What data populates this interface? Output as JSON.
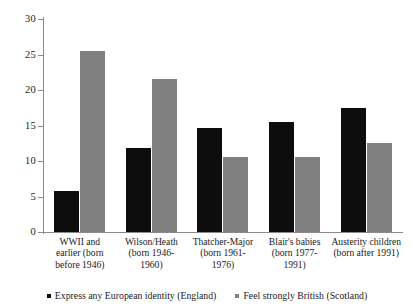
{
  "chart_data": {
    "type": "bar",
    "title": "",
    "xlabel": "",
    "ylabel": "",
    "ylim": [
      0,
      30
    ],
    "yticks": [
      0,
      5,
      10,
      15,
      20,
      25,
      30
    ],
    "grid": false,
    "legend_position": "bottom",
    "categories": [
      "WWII and earlier (born before 1946)",
      "Wilson/Heath (born 1946-1960)",
      "Thatcher-Major (born 1961-1976)",
      "Blair's babies (born 1977-1991)",
      "Austerity children (born after 1991)"
    ],
    "category_lines": [
      [
        "WWII and",
        "earlier (born",
        "before 1946)"
      ],
      [
        "Wilson/Heath",
        "(born 1946-",
        "1960)"
      ],
      [
        "Thatcher-Major",
        "(born 1961-",
        "1976)"
      ],
      [
        "Blair's babies",
        "(born 1977-",
        "1991)"
      ],
      [
        "Austerity children",
        "(born after 1991)"
      ]
    ],
    "series": [
      {
        "name": "Express any European identity (England)",
        "color": "#0d0d0d",
        "values": [
          5.8,
          11.8,
          14.7,
          15.5,
          17.5
        ]
      },
      {
        "name": "Feel strongly British (Scotland)",
        "color": "#808080",
        "values": [
          25.5,
          21.5,
          10.5,
          10.5,
          12.6
        ]
      }
    ]
  },
  "legend": {
    "items": [
      {
        "label": "Express any European identity (England)",
        "marker": "square-black"
      },
      {
        "label": "Feel strongly British (Scotland)",
        "marker": "square-gray"
      }
    ]
  }
}
